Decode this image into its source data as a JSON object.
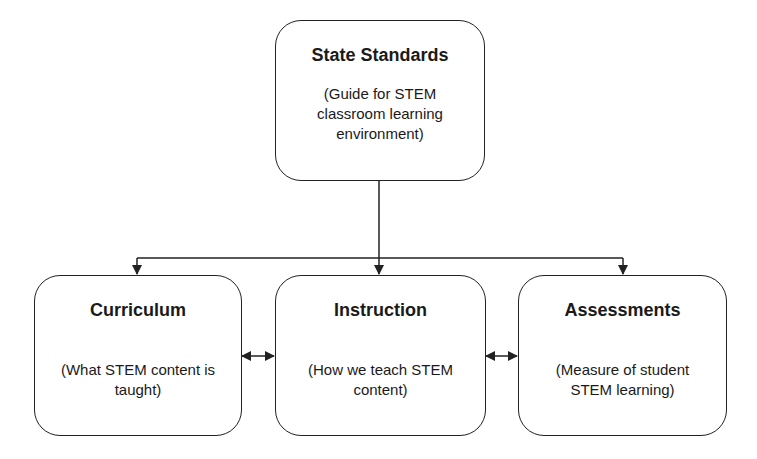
{
  "diagram": {
    "top": {
      "title": "State Standards",
      "description": "(Guide for STEM classroom learning environment)"
    },
    "children": [
      {
        "title": "Curriculum",
        "description": "(What STEM content is taught)"
      },
      {
        "title": "Instruction",
        "description": "(How we teach STEM content)"
      },
      {
        "title": "Assessments",
        "description": "(Measure of student STEM learning)"
      }
    ],
    "edges": [
      {
        "from": "State Standards",
        "to": "Curriculum",
        "type": "arrow"
      },
      {
        "from": "State Standards",
        "to": "Instruction",
        "type": "arrow"
      },
      {
        "from": "State Standards",
        "to": "Assessments",
        "type": "arrow"
      },
      {
        "from": "Curriculum",
        "to": "Instruction",
        "type": "bidirectional"
      },
      {
        "from": "Instruction",
        "to": "Assessments",
        "type": "bidirectional"
      }
    ],
    "colors": {
      "stroke": "#222222",
      "background": "#ffffff",
      "text": "#1a1a1a"
    }
  }
}
